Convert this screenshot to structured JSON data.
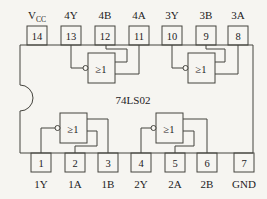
{
  "chip": {
    "part_number": "74LS02",
    "gate_symbol": "≥1"
  },
  "top_pins": [
    {
      "number": "14",
      "label": "V",
      "label_sub": "CC"
    },
    {
      "number": "13",
      "label": "4Y"
    },
    {
      "number": "12",
      "label": "4B"
    },
    {
      "number": "11",
      "label": "4A"
    },
    {
      "number": "10",
      "label": "3Y"
    },
    {
      "number": "9",
      "label": "3B"
    },
    {
      "number": "8",
      "label": "3A"
    }
  ],
  "bottom_pins": [
    {
      "number": "1",
      "label": "1Y"
    },
    {
      "number": "2",
      "label": "1A"
    },
    {
      "number": "3",
      "label": "1B"
    },
    {
      "number": "4",
      "label": "2Y"
    },
    {
      "number": "5",
      "label": "2A"
    },
    {
      "number": "6",
      "label": "2B"
    },
    {
      "number": "7",
      "label": "GND"
    }
  ],
  "colors": {
    "background": "#f6f5f1",
    "line": "#45443e",
    "text": "#23221d"
  }
}
